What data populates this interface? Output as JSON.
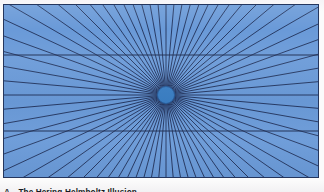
{
  "figure": {
    "panel_label": "A",
    "caption_title": "The Hering-Helmholtz Illusion",
    "alt_name": "hering-illusion-figure"
  },
  "colors": {
    "page_background": "#fdfdfd",
    "panel_background": "#6a9ad8",
    "panel_border": "#24365e",
    "ray_color": "#1f2f57",
    "horizontal_line_color": "#1d2c52",
    "center_disc_fill": "#3b7fc4",
    "center_disc_stroke": "#2a5f9e",
    "caption_text": "#171a22"
  },
  "panel": {
    "x": 3,
    "y": 4,
    "width": 316,
    "height": 174
  },
  "chart_data": {
    "type": "scatter",
    "title": "The Hering-Helmholtz Illusion",
    "xlabel": "",
    "ylabel": "",
    "radiant_center": {
      "x": 162,
      "y": 90
    },
    "ray_count": 72,
    "ray_start_angle_deg": 0,
    "ray_angle_step_deg": 5,
    "ray_length": 760,
    "ray_stroke_width": 0.9,
    "horizontal_lines": [
      {
        "name": "upper-parallel-line",
        "y": 50,
        "x1": 0,
        "x2": 316
      },
      {
        "name": "lower-parallel-line",
        "y": 126,
        "x1": 0,
        "x2": 316
      }
    ],
    "horizontal_line_width": 1.1,
    "center_disc": {
      "cx": 162,
      "cy": 90,
      "r": 8.5
    },
    "axis_ranges": {
      "xlim": [
        0,
        316
      ],
      "ylim": [
        0,
        174
      ]
    },
    "grid": false,
    "legend": false
  }
}
